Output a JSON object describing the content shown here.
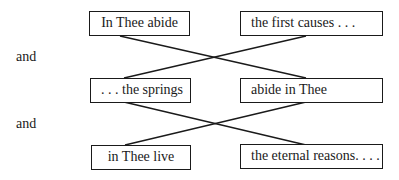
{
  "diagram": {
    "connector_labels": [
      "and",
      "and"
    ],
    "rows": [
      {
        "left": "In Thee abide",
        "right": "the first causes . . ."
      },
      {
        "left": ". . . the springs",
        "right": "abide in Thee"
      },
      {
        "left": "in Thee live",
        "right": "the eternal reasons. . . ."
      }
    ],
    "line_color": "#1a1a1a"
  }
}
